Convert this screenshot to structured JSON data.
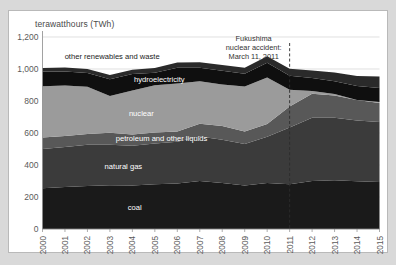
{
  "chart_data": {
    "type": "area",
    "title": "",
    "subtitle": "",
    "xlabel": "",
    "ylabel": "terawatthours (TWh)",
    "unit_label": "terawatthours (TWh)",
    "grid": true,
    "legend_position": "inline-labels",
    "stacked": true,
    "xlim": [
      2000,
      2015
    ],
    "ylim": [
      0,
      1200
    ],
    "yticks": [
      0,
      200,
      400,
      600,
      800,
      1000,
      1200
    ],
    "ytick_labels": [
      "0",
      "200",
      "400",
      "600",
      "800",
      "1,000",
      "1,200"
    ],
    "x": [
      2000,
      2001,
      2002,
      2003,
      2004,
      2005,
      2006,
      2007,
      2008,
      2009,
      2010,
      2011,
      2012,
      2013,
      2014,
      2015
    ],
    "categories": [
      "2000",
      "2001",
      "2002",
      "2003",
      "2004",
      "2005",
      "2006",
      "2007",
      "2008",
      "2009",
      "2010",
      "2011",
      "2012",
      "2013",
      "2014",
      "2015"
    ],
    "xtick_labels": [
      "2000",
      "2001",
      "2002",
      "2003",
      "2004",
      "2005",
      "2006",
      "2007",
      "2008",
      "2009",
      "2010",
      "2011",
      "2012",
      "2013",
      "2014",
      "2015"
    ],
    "series": [
      {
        "name": "coal",
        "label": "coal",
        "color": "#1a1a1a",
        "label_color": "#ffffff",
        "values": [
          255,
          262,
          268,
          274,
          272,
          280,
          285,
          300,
          288,
          272,
          287,
          280,
          300,
          305,
          298,
          293
        ]
      },
      {
        "name": "natural gas",
        "label": "natural gas",
        "color": "#3b3b3b",
        "label_color": "#ffffff",
        "values": [
          245,
          250,
          258,
          252,
          248,
          255,
          260,
          278,
          270,
          260,
          290,
          355,
          395,
          390,
          380,
          375
        ]
      },
      {
        "name": "petroleum and other liquids",
        "label": "petroleum and other liquids",
        "color": "#585858",
        "label_color": "#ffffff",
        "values": [
          72,
          70,
          68,
          75,
          70,
          68,
          65,
          80,
          85,
          78,
          80,
          130,
          150,
          140,
          128,
          120
        ]
      },
      {
        "name": "nuclear",
        "label": "nuclear",
        "color": "#9b9b9b",
        "label_color": "#ffffff",
        "values": [
          320,
          315,
          295,
          230,
          275,
          295,
          300,
          265,
          260,
          280,
          290,
          105,
          18,
          9,
          0,
          5
        ]
      },
      {
        "name": "hydroelectricity",
        "label": "hydroelectricity",
        "color": "#0f0f0f",
        "label_color": "#ffffff",
        "values": [
          92,
          88,
          86,
          105,
          103,
          78,
          98,
          85,
          86,
          80,
          92,
          88,
          80,
          80,
          88,
          88
        ]
      },
      {
        "name": "other renewables and waste",
        "label": "other renewables and waste",
        "color": "#2a2a2a",
        "label_color": "#1b1b1b",
        "values": [
          23,
          24,
          25,
          26,
          28,
          30,
          32,
          34,
          36,
          38,
          41,
          44,
          48,
          54,
          62,
          72
        ]
      }
    ],
    "annotations": [
      {
        "name": "fukushima-event",
        "lines": [
          "Fukushima",
          "nuclear accident:",
          "March 11, 2011"
        ],
        "x_year": 2011,
        "line_style": "dashed"
      }
    ]
  }
}
